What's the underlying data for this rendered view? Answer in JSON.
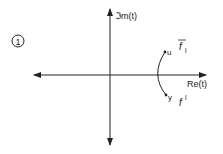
{
  "figure": {
    "number": "1",
    "axes": {
      "x_label": "Re(t)",
      "y_label": "Im(t)",
      "y_label_display": "ℑm(t)"
    },
    "points": [
      {
        "name": "u",
        "label": "u"
      },
      {
        "name": "y",
        "label": "y"
      }
    ],
    "curve_labels": {
      "upper": {
        "base": "f",
        "sub": "l",
        "overbar": true
      },
      "lower": {
        "base": "f",
        "sup": "l"
      }
    },
    "colors": {
      "ink": "#222222",
      "background": "#ffffff"
    }
  }
}
